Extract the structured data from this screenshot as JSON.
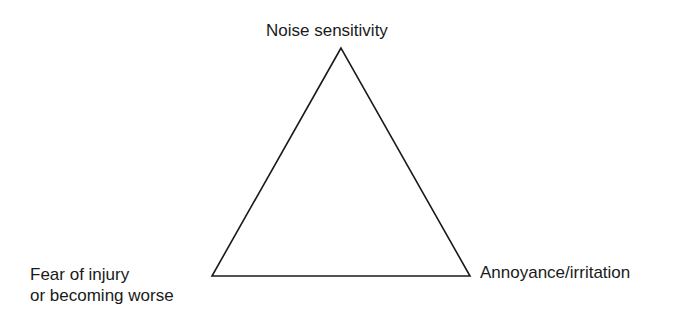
{
  "diagram": {
    "type": "triangle",
    "vertices": {
      "top": {
        "label": "Noise sensitivity"
      },
      "bottom_left": {
        "label_line1": "Fear of injury",
        "label_line2": "or becoming worse"
      },
      "bottom_right": {
        "label": "Annoyance/irritation"
      }
    },
    "stroke_color": "#1a1a1a"
  }
}
